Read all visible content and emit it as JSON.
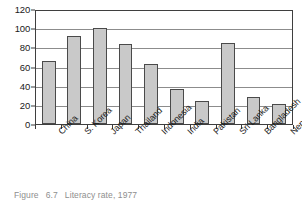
{
  "figure": {
    "caption_label": "Figure",
    "caption_number": "6.7",
    "caption_text": "Literacy rate, 1977"
  },
  "chart_data": {
    "type": "bar",
    "title": "",
    "xlabel": "",
    "ylabel": "",
    "ylim": [
      0,
      120
    ],
    "ytick_step": 20,
    "grid": true,
    "legend": "none",
    "bar_fill_color": "#c9c9c9",
    "bar_border_color": "#4a4a4a",
    "categories": [
      "China",
      "S. Korea",
      "Japan",
      "Thailand",
      "Indonesia",
      "India",
      "Pakistan",
      "Sri Lanka",
      "Bangladesh",
      "Nepal"
    ],
    "values": [
      66,
      92,
      100,
      84,
      63,
      37,
      24,
      85,
      28,
      21
    ],
    "ytick_labels": [
      "0",
      "20",
      "40",
      "60",
      "80",
      "100",
      "120"
    ]
  }
}
